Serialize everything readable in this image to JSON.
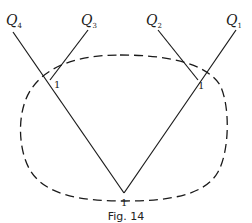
{
  "figure": {
    "caption": "Fig. 14",
    "colors": {
      "line": "#1a1a1a",
      "dashed": "#1a1a1a",
      "background": "#ffffff"
    },
    "leaves": [
      {
        "id": "Q4",
        "letter": "Q",
        "sub": "4"
      },
      {
        "id": "Q3",
        "letter": "Q",
        "sub": "3"
      },
      {
        "id": "Q2",
        "letter": "Q",
        "sub": "2"
      },
      {
        "id": "Q1",
        "letter": "Q",
        "sub": "1"
      }
    ],
    "vertex_labels": {
      "left": "1",
      "right": "1",
      "bottom": "1"
    },
    "boundary": {
      "style": "dashed",
      "shape": "closed-curve"
    }
  }
}
